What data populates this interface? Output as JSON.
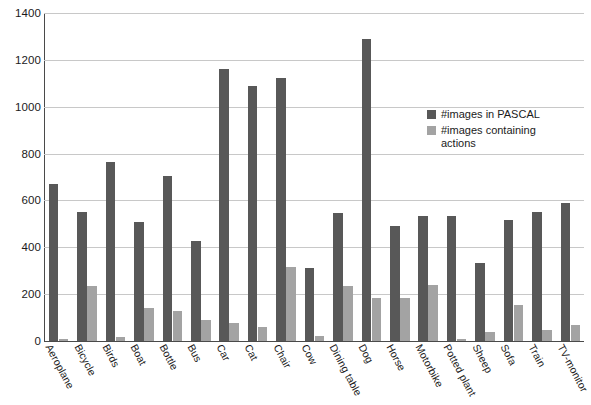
{
  "chart_data": {
    "type": "bar",
    "title": "",
    "subtitle": "",
    "xlabel": "",
    "ylabel": "",
    "ylim": [
      0,
      1400
    ],
    "ytick_step": 200,
    "yticks": [
      "1400",
      "1200",
      "1000",
      "800",
      "600",
      "400",
      "200",
      "0"
    ],
    "grid": true,
    "legend_position": "inside-right",
    "categories": [
      "Aeroplane",
      "Bicycle",
      "Birds",
      "Boat",
      "Bottle",
      "Bus",
      "Car",
      "Cat",
      "Chair",
      "Cow",
      "Dining table",
      "Dog",
      "Horse",
      "Motorbike",
      "Potted plant",
      "Sheep",
      "Sofa",
      "Train",
      "TV-monitor"
    ],
    "series": [
      {
        "name": "#images in PASCAL",
        "color": "#585858",
        "values": [
          670,
          552,
          765,
          508,
          706,
          428,
          1160,
          1088,
          1124,
          312,
          545,
          1290,
          490,
          533,
          535,
          335,
          515,
          550,
          588
        ]
      },
      {
        "name": "#images containing actions",
        "color": "#a3a3a3",
        "values": [
          10,
          235,
          18,
          140,
          128,
          90,
          75,
          58,
          315,
          20,
          235,
          185,
          185,
          240,
          10,
          40,
          155,
          45,
          68
        ]
      }
    ]
  },
  "legend": {
    "items": [
      {
        "label": "#images in PASCAL",
        "swatch": "dark"
      },
      {
        "label": "#images containing actions",
        "swatch": "light"
      }
    ]
  },
  "colors": {
    "series_dark": "#585858",
    "series_light": "#a3a3a3",
    "grid": "#c8c8c8",
    "axis": "#4a4a4a",
    "text": "#1b1b1b",
    "background": "#ffffff"
  }
}
